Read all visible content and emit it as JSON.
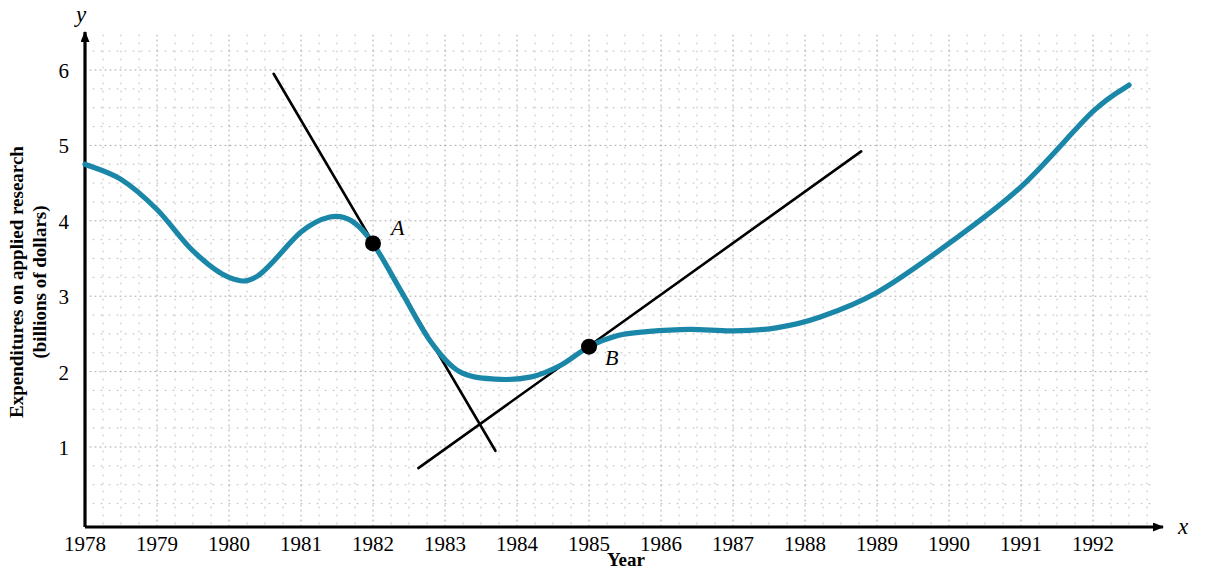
{
  "chart_data": {
    "type": "line",
    "title": "",
    "xlabel": "Year",
    "ylabel": "Expenditures on applied research (billions of dollars)",
    "ylabel_line1": "Expenditures on applied research",
    "ylabel_line2": "(billions of dollars)",
    "x_axis_letter": "x",
    "y_axis_letter": "y",
    "xlim": [
      1977.6,
      1992.9
    ],
    "ylim": [
      0,
      6.45
    ],
    "grid": "dotted minor grid at 0.25 year and 0.25 unit intervals",
    "legend": "none",
    "xticks": [
      "1978",
      "1979",
      "1980",
      "1981",
      "1982",
      "1983",
      "1984",
      "1985",
      "1986",
      "1987",
      "1988",
      "1989",
      "1990",
      "1991",
      "1992"
    ],
    "yticks": [
      "1",
      "2",
      "3",
      "4",
      "5",
      "6"
    ],
    "series": [
      {
        "name": "Expenditures on applied research",
        "color": "#1b87a8",
        "x": [
          1978.0,
          1978.5,
          1979.0,
          1979.5,
          1980.0,
          1980.4,
          1981.0,
          1981.4,
          1981.7,
          1982.0,
          1982.4,
          1982.8,
          1983.2,
          1983.7,
          1984.2,
          1984.6,
          1985.0,
          1985.4,
          1985.8,
          1986.4,
          1987.0,
          1987.6,
          1988.2,
          1989.0,
          1990.0,
          1991.0,
          1992.0,
          1992.5
        ],
        "y": [
          4.75,
          4.55,
          4.15,
          3.6,
          3.25,
          3.27,
          3.85,
          4.05,
          4.0,
          3.7,
          3.05,
          2.4,
          2.0,
          1.9,
          1.93,
          2.08,
          2.33,
          2.48,
          2.53,
          2.56,
          2.54,
          2.58,
          2.72,
          3.05,
          3.7,
          4.45,
          5.45,
          5.8
        ]
      }
    ],
    "points": [
      {
        "label": "A",
        "x": 1982.0,
        "y": 3.7,
        "label_dx": 18,
        "label_dy": -8
      },
      {
        "label": "B",
        "x": 1985.0,
        "y": 2.33,
        "label_dx": 16,
        "label_dy": 18
      }
    ],
    "tangent_lines": [
      {
        "at_point": "A",
        "x1": 1980.62,
        "y1": 5.95,
        "x2": 1983.7,
        "y2": 0.95,
        "slope": -1.62,
        "color": "#000000"
      },
      {
        "at_point": "B",
        "x1": 1982.63,
        "y1": 0.72,
        "x2": 1988.78,
        "y2": 4.92,
        "slope": 0.68,
        "color": "#000000"
      }
    ]
  }
}
